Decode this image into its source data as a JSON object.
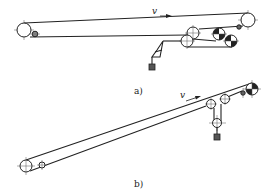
{
  "figure": {
    "subfigures": [
      {
        "id": "a",
        "caption": "a)",
        "description": "Horizontal belt conveyor with counterweight tensioning via multiple bend/drive pulleys",
        "velocity_label": "v"
      },
      {
        "id": "b",
        "caption": "b)",
        "description": "Inclined belt conveyor with vertical gravity take-up",
        "velocity_label": "v"
      }
    ]
  },
  "colors": {
    "line": "#222222",
    "background": "#ffffff"
  }
}
